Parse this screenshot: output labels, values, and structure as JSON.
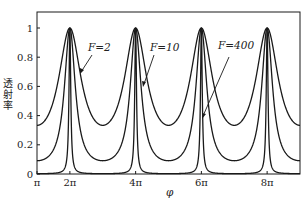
{
  "chart_data": {
    "type": "line",
    "title": "",
    "xlabel": "φ",
    "ylabel": "透射率",
    "x_tick_labels": [
      "π",
      "2π",
      "4π",
      "6π",
      "8π"
    ],
    "x_ticks": [
      3.14159,
      6.28319,
      12.56637,
      18.84956,
      25.13274
    ],
    "y_tick_labels": [
      "0",
      "0.2",
      "0.4",
      "0.6",
      "0.8",
      "1"
    ],
    "xlim": [
      3.14159,
      28.27433
    ],
    "ylim": [
      0,
      1.1
    ],
    "grid": false,
    "formula": "T = 1 / (1 + F sin^2(φ/2))",
    "series": [
      {
        "name": "F=2",
        "F": 2,
        "min": 0.333,
        "max": 1,
        "peaks_at": [
          "2π",
          "4π",
          "6π",
          "8π"
        ]
      },
      {
        "name": "F=10",
        "F": 10,
        "min": 0.091,
        "max": 1,
        "peaks_at": [
          "2π",
          "4π",
          "6π",
          "8π"
        ]
      },
      {
        "name": "F=400",
        "F": 400,
        "min": 0.0025,
        "max": 1,
        "peaks_at": [
          "2π",
          "4π",
          "6π",
          "8π"
        ]
      }
    ],
    "annotations": [
      {
        "text": "F=2",
        "points_to": "F=2 curve near 2π"
      },
      {
        "text": "F=10",
        "points_to": "F=10 curve near 4π"
      },
      {
        "text": "F=400",
        "points_to": "F=400 curve near 6π"
      }
    ]
  },
  "labels": {
    "ylabel": "透射率",
    "xlabel": "φ",
    "ann_f2": "F=2",
    "ann_f10": "F=10",
    "ann_f400": "F=400",
    "xticks": [
      "π",
      "2π",
      "4π",
      "6π",
      "8π"
    ],
    "yticks": [
      "0",
      "0.2",
      "0.4",
      "0.6",
      "0.8",
      "1"
    ]
  }
}
